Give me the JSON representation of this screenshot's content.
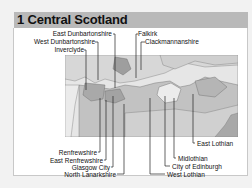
{
  "header": {
    "title": "1 Central Scotland"
  },
  "map": {
    "colors": {
      "sea": "#e4e4e4",
      "land_light": "#cfcfcf",
      "land_mid": "#b8b8b8",
      "land_dark": "#a5a5a5",
      "border": "#666666",
      "leader": "#222222"
    }
  },
  "labels": {
    "top_left": [
      "East Dunbartonshire",
      "West Dunbartonshire",
      "Inverclyde"
    ],
    "top_right": [
      "Falkirk",
      "Clackmannanshire"
    ],
    "bottom_left": [
      "Renfrewshire",
      "East Renfrewshire",
      "Glasgow City",
      "North Lanarkshire"
    ],
    "bottom_right": [
      "East Lothian",
      "Midlothian",
      "City of Edinburgh",
      "West Lothian"
    ]
  }
}
